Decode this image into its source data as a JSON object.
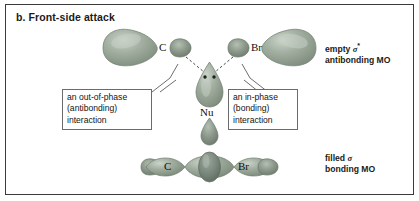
{
  "figure": {
    "title": "b. Front-side attack",
    "border_color": "#3a3a3a",
    "background": "#ffffff"
  },
  "orbitals": {
    "fill_color": "#8c9a8c",
    "highlight_color": "#c3cdc1",
    "dark_color": "#6e7b6e",
    "lobe_outline": "#6f7c6f"
  },
  "antibonding_mo": {
    "atoms": [
      {
        "name": "carbon",
        "label": "C"
      },
      {
        "name": "bromine",
        "label": "Br"
      }
    ],
    "nucleophile": {
      "label": "Nu",
      "lone_pair_dots": 2
    },
    "side_label_line1": "empty ",
    "side_label_symbol": "σ",
    "side_label_star": "*",
    "side_label_line2": "antibonding MO"
  },
  "bonding_mo": {
    "atoms": [
      {
        "name": "carbon",
        "label": "C"
      },
      {
        "name": "bromine",
        "label": "Br"
      }
    ],
    "side_label_line1": "filled ",
    "side_label_symbol": "σ",
    "side_label_line2": "bonding MO"
  },
  "callouts": [
    {
      "name": "out-of-phase",
      "line1": "an out-of-phase",
      "line2": "(antibonding)",
      "line3": "interaction"
    },
    {
      "name": "in-phase",
      "line1": "an in-phase",
      "line2": "(bonding)",
      "line3": "interaction"
    }
  ]
}
